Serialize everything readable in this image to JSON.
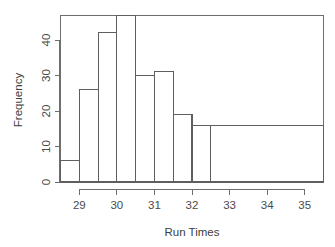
{
  "chart_data": {
    "type": "bar",
    "title": "",
    "subtitle": "",
    "xlabel": "Run Times",
    "ylabel": "Frequency",
    "grid": false,
    "legend": "none",
    "xlim": [
      28.5,
      35.5
    ],
    "ylim": [
      0,
      49
    ],
    "xticks": [
      29,
      30,
      31,
      32,
      33,
      34,
      35
    ],
    "xticklabels": [
      "29",
      "30",
      "31",
      "32",
      "33",
      "34",
      "35"
    ],
    "yticks": [
      0,
      10,
      20,
      30,
      40
    ],
    "yticklabels": [
      "0",
      "10",
      "20",
      "30",
      "40"
    ],
    "bin_edges": [
      28.5,
      29.0,
      29.5,
      30.0,
      30.5,
      31.0,
      31.5,
      32.0,
      32.5,
      35.5
    ],
    "categories": [
      "28.5-29.0",
      "29.0-29.5",
      "29.5-30.0",
      "30.0-30.5",
      "30.5-31.0",
      "31.0-31.5",
      "31.5-32.0",
      "32.0-32.5",
      "32.5-35.5"
    ],
    "values": [
      6,
      26,
      42,
      47,
      30,
      31,
      19,
      16,
      16
    ],
    "bars": [
      {
        "x0": 28.5,
        "x1": 29.0,
        "height": 6
      },
      {
        "x0": 29.0,
        "x1": 29.5,
        "height": 26
      },
      {
        "x0": 29.5,
        "x1": 30.0,
        "height": 42
      },
      {
        "x0": 30.0,
        "x1": 30.5,
        "height": 47
      },
      {
        "x0": 30.5,
        "x1": 31.0,
        "height": 30
      },
      {
        "x0": 31.0,
        "x1": 31.5,
        "height": 31
      },
      {
        "x0": 31.5,
        "x1": 32.0,
        "height": 19
      },
      {
        "x0": 32.0,
        "x1": 32.5,
        "height": 16
      },
      {
        "x0": 32.5,
        "x1": 35.5,
        "height": 16
      }
    ],
    "colors": {
      "bar_fill": "#ffffff",
      "bar_stroke": "#5f5f5f",
      "axis": "#6e6e6e",
      "text": "#3d3d3d",
      "background": "#ffffff"
    }
  },
  "labels": {
    "xlabel": "Run Times",
    "ylabel": "Frequency"
  }
}
